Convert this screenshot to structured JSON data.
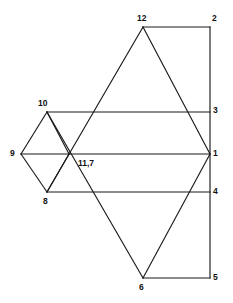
{
  "figure": {
    "background_color": "#ffffff",
    "line_color": "#1a1a1a",
    "label_color": "#111111",
    "width": 233,
    "height": 303
  },
  "vertices": [
    {
      "id": "v12",
      "label": "12",
      "x": 143,
      "y": 27,
      "label_x": 137,
      "label_y": 14
    },
    {
      "id": "v2",
      "label": "2",
      "x": 210,
      "y": 27,
      "label_x": 212,
      "label_y": 14
    },
    {
      "id": "v10",
      "label": "10",
      "x": 47,
      "y": 112,
      "label_x": 38,
      "label_y": 99
    },
    {
      "id": "v3",
      "label": "3",
      "x": 210,
      "y": 112,
      "label_x": 213,
      "label_y": 106
    },
    {
      "id": "v9",
      "label": "9",
      "x": 21,
      "y": 154,
      "label_x": 10,
      "label_y": 149
    },
    {
      "id": "v117",
      "label": "11,7",
      "x": 69,
      "y": 154,
      "label_x": 78,
      "label_y": 159
    },
    {
      "id": "v1",
      "label": "1",
      "x": 210,
      "y": 154,
      "label_x": 213,
      "label_y": 149
    },
    {
      "id": "v8",
      "label": "8",
      "x": 47,
      "y": 192,
      "label_x": 43,
      "label_y": 197
    },
    {
      "id": "v4",
      "label": "4",
      "x": 210,
      "y": 192,
      "label_x": 213,
      "label_y": 187
    },
    {
      "id": "v6",
      "label": "6",
      "x": 143,
      "y": 278,
      "label_x": 139,
      "label_y": 283
    },
    {
      "id": "v5",
      "label": "5",
      "x": 210,
      "y": 278,
      "label_x": 213,
      "label_y": 273
    }
  ],
  "edges": [
    {
      "name": "edge-12-2",
      "from": "v12",
      "to": "v2"
    },
    {
      "name": "edge-2-5",
      "from": "v2",
      "to": "v5"
    },
    {
      "name": "edge-10-3",
      "from": "v10",
      "to": "v3"
    },
    {
      "name": "edge-9-1",
      "from": "v9",
      "to": "v1"
    },
    {
      "name": "edge-8-4",
      "from": "v8",
      "to": "v4"
    },
    {
      "name": "edge-6-5",
      "from": "v6",
      "to": "v5"
    },
    {
      "name": "edge-9-10",
      "from": "v9",
      "to": "v10"
    },
    {
      "name": "edge-9-8",
      "from": "v9",
      "to": "v8"
    },
    {
      "name": "edge-10-117",
      "from": "v10",
      "to": "v117"
    },
    {
      "name": "edge-117-8",
      "from": "v117",
      "to": "v8"
    },
    {
      "name": "edge-12-117-8-ray",
      "from": "v12",
      "to": "v8"
    },
    {
      "name": "edge-12-1",
      "from": "v12",
      "to": "v1"
    },
    {
      "name": "edge-10-6",
      "from": "v10",
      "to": "v6"
    },
    {
      "name": "edge-1-6",
      "from": "v1",
      "to": "v6"
    }
  ],
  "labels_visible": [
    "12",
    "2",
    "10",
    "3",
    "9",
    "11,7",
    "1",
    "8",
    "4",
    "6",
    "5"
  ]
}
